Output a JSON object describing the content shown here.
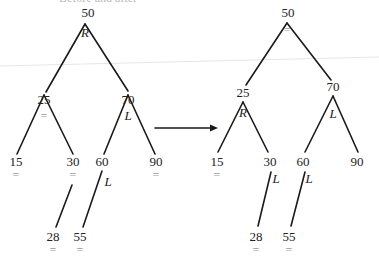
{
  "diagram": {
    "title_cutoff": "Before and after",
    "arrow": {
      "x1": 155,
      "y1": 128,
      "x2": 218,
      "y2": 128
    },
    "colors": {
      "line": "#1a1a1a",
      "text": "#222222",
      "balance": "#9a9a9a"
    },
    "left_tree": {
      "nodes": [
        {
          "key": "50",
          "x": 88,
          "y": 17,
          "balance": "R",
          "bx": 85,
          "by": 37,
          "btype": "tag"
        },
        {
          "key": "25",
          "x": 44,
          "y": 104,
          "balance": "=",
          "bx": 44,
          "by": 120,
          "btype": "bal"
        },
        {
          "key": "70",
          "x": 128,
          "y": 104,
          "balance": "L",
          "bx": 128,
          "by": 120,
          "btype": "tag"
        },
        {
          "key": "15",
          "x": 16,
          "y": 166,
          "balance": "=",
          "bx": 16,
          "by": 179,
          "btype": "bal"
        },
        {
          "key": "30",
          "x": 73,
          "y": 166,
          "balance": "=",
          "bx": 73,
          "by": 179,
          "btype": "bal"
        },
        {
          "key": "60",
          "x": 102,
          "y": 166,
          "balance": "L",
          "bx": 108,
          "by": 186,
          "btype": "tag"
        },
        {
          "key": "90",
          "x": 156,
          "y": 166,
          "balance": "=",
          "bx": 156,
          "by": 179,
          "btype": "bal"
        },
        {
          "key": "28",
          "x": 53,
          "y": 241,
          "balance": "=",
          "bx": 53,
          "by": 254,
          "btype": "bal"
        },
        {
          "key": "55",
          "x": 80,
          "y": 241,
          "balance": "=",
          "bx": 80,
          "by": 254,
          "btype": "bal"
        }
      ],
      "edges": [
        {
          "x1": 85,
          "y1": 24,
          "x2": 46,
          "y2": 92
        },
        {
          "x1": 85,
          "y1": 24,
          "x2": 128,
          "y2": 91
        },
        {
          "x1": 44,
          "y1": 95,
          "x2": 17,
          "y2": 154
        },
        {
          "x1": 44,
          "y1": 95,
          "x2": 73,
          "y2": 154
        },
        {
          "x1": 128,
          "y1": 95,
          "x2": 104,
          "y2": 154
        },
        {
          "x1": 128,
          "y1": 95,
          "x2": 155,
          "y2": 154
        },
        {
          "x1": 72,
          "y1": 185,
          "x2": 56,
          "y2": 227
        },
        {
          "x1": 102,
          "y1": 171,
          "x2": 83,
          "y2": 227
        }
      ]
    },
    "right_tree": {
      "nodes": [
        {
          "key": "50",
          "x": 288,
          "y": 17,
          "balance": "=",
          "bx": 287,
          "by": 34,
          "btype": "bal"
        },
        {
          "key": "25",
          "x": 243,
          "y": 97,
          "balance": "R",
          "bx": 243,
          "by": 117,
          "btype": "tag"
        },
        {
          "key": "70",
          "x": 333,
          "y": 91,
          "balance": "L",
          "bx": 333,
          "by": 118,
          "btype": "tag"
        },
        {
          "key": "15",
          "x": 217,
          "y": 166,
          "balance": "=",
          "bx": 217,
          "by": 179,
          "btype": "bal"
        },
        {
          "key": "30",
          "x": 270,
          "y": 166,
          "balance": "L",
          "bx": 276,
          "by": 183,
          "btype": "tag"
        },
        {
          "key": "60",
          "x": 303,
          "y": 166,
          "balance": "L",
          "bx": 309,
          "by": 183,
          "btype": "tag"
        },
        {
          "key": "90",
          "x": 357,
          "y": 166,
          "balance": "",
          "bx": 357,
          "by": 179,
          "btype": "bal"
        },
        {
          "key": "28",
          "x": 256,
          "y": 241,
          "balance": "=",
          "bx": 256,
          "by": 254,
          "btype": "bal"
        },
        {
          "key": "55",
          "x": 289,
          "y": 241,
          "balance": "=",
          "bx": 289,
          "by": 254,
          "btype": "bal"
        }
      ],
      "edges": [
        {
          "x1": 287,
          "y1": 23,
          "x2": 246,
          "y2": 85
        },
        {
          "x1": 287,
          "y1": 23,
          "x2": 331,
          "y2": 80
        },
        {
          "x1": 243,
          "y1": 102,
          "x2": 218,
          "y2": 152
        },
        {
          "x1": 243,
          "y1": 102,
          "x2": 268,
          "y2": 152
        },
        {
          "x1": 333,
          "y1": 96,
          "x2": 305,
          "y2": 152
        },
        {
          "x1": 333,
          "y1": 96,
          "x2": 358,
          "y2": 152
        },
        {
          "x1": 271,
          "y1": 172,
          "x2": 258,
          "y2": 226
        },
        {
          "x1": 305,
          "y1": 172,
          "x2": 291,
          "y2": 226
        }
      ]
    }
  }
}
